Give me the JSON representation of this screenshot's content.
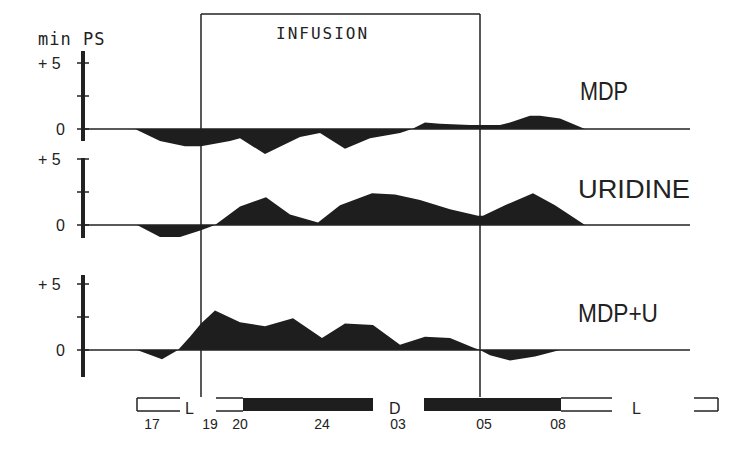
{
  "chart_data": {
    "type": "area",
    "title": "",
    "ylabel": "min PS",
    "xlabel": "",
    "infusion_label": "INFUSION",
    "infusion_window": {
      "start_x": 201,
      "end_x": 480
    },
    "ytick_labels": [
      "+ 5",
      "0"
    ],
    "units_per_tick": 5,
    "px_per_unit": 13.2,
    "time_ticks": [
      {
        "label": "17",
        "x": 152
      },
      {
        "label": "19",
        "x": 210
      },
      {
        "label": "20",
        "x": 240
      },
      {
        "label": "24",
        "x": 322
      },
      {
        "label": "03",
        "x": 398
      },
      {
        "label": "05",
        "x": 484
      },
      {
        "label": "08",
        "x": 558
      }
    ],
    "light_dark_bar": {
      "light_label_left": "L",
      "dark_label": "D",
      "light_label_right": "L",
      "segments": [
        {
          "type": "light",
          "x0": 137,
          "x1": 180
        },
        {
          "type": "light",
          "x0": 216,
          "x1": 243
        },
        {
          "type": "dark",
          "x0": 243,
          "x1": 373
        },
        {
          "type": "dark",
          "x0": 424,
          "x1": 561
        },
        {
          "type": "light",
          "x0": 561,
          "x1": 612
        },
        {
          "type": "light",
          "x0": 694,
          "x1": 718
        }
      ]
    },
    "series": [
      {
        "name": "MDP",
        "zero_y": 129,
        "axis_top": 51,
        "axis_bottom": 141,
        "points": [
          [
            83,
            0
          ],
          [
            135,
            0
          ],
          [
            160,
            -0.9
          ],
          [
            185,
            -1.3
          ],
          [
            201,
            -1.3
          ],
          [
            230,
            -0.9
          ],
          [
            240,
            -0.7
          ],
          [
            265,
            -1.9
          ],
          [
            300,
            -0.6
          ],
          [
            320,
            -0.3
          ],
          [
            345,
            -1.5
          ],
          [
            370,
            -0.7
          ],
          [
            400,
            -0.3
          ],
          [
            412,
            0
          ],
          [
            425,
            0.5
          ],
          [
            440,
            0.4
          ],
          [
            470,
            0.3
          ],
          [
            480,
            0.3
          ],
          [
            500,
            0.3
          ],
          [
            510,
            0.5
          ],
          [
            530,
            1.0
          ],
          [
            540,
            1.0
          ],
          [
            560,
            0.8
          ],
          [
            585,
            0
          ],
          [
            690,
            0
          ]
        ]
      },
      {
        "name": "URIDINE",
        "zero_y": 225,
        "axis_top": 158,
        "axis_bottom": 238,
        "points": [
          [
            83,
            0
          ],
          [
            137,
            0
          ],
          [
            160,
            -0.9
          ],
          [
            180,
            -0.9
          ],
          [
            201,
            -0.4
          ],
          [
            215,
            0
          ],
          [
            240,
            1.4
          ],
          [
            266,
            2.1
          ],
          [
            290,
            0.8
          ],
          [
            318,
            0.2
          ],
          [
            340,
            1.5
          ],
          [
            372,
            2.4
          ],
          [
            395,
            2.3
          ],
          [
            420,
            1.9
          ],
          [
            450,
            1.2
          ],
          [
            478,
            0.7
          ],
          [
            483,
            0.7
          ],
          [
            505,
            1.5
          ],
          [
            533,
            2.4
          ],
          [
            555,
            1.5
          ],
          [
            585,
            0
          ],
          [
            690,
            0
          ]
        ]
      },
      {
        "name": "MDP+U",
        "zero_y": 350,
        "axis_top": 275,
        "axis_bottom": 377,
        "points": [
          [
            83,
            0
          ],
          [
            137,
            0
          ],
          [
            162,
            -0.7
          ],
          [
            178,
            0
          ],
          [
            190,
            1.0
          ],
          [
            201,
            2.0
          ],
          [
            215,
            3.0
          ],
          [
            240,
            2.1
          ],
          [
            265,
            1.8
          ],
          [
            293,
            2.4
          ],
          [
            322,
            0.9
          ],
          [
            345,
            2.0
          ],
          [
            373,
            1.9
          ],
          [
            400,
            0.4
          ],
          [
            425,
            1.0
          ],
          [
            450,
            0.9
          ],
          [
            473,
            0.2
          ],
          [
            480,
            0
          ],
          [
            490,
            -0.4
          ],
          [
            510,
            -0.8
          ],
          [
            535,
            -0.5
          ],
          [
            560,
            0
          ],
          [
            690,
            0
          ]
        ]
      }
    ]
  }
}
